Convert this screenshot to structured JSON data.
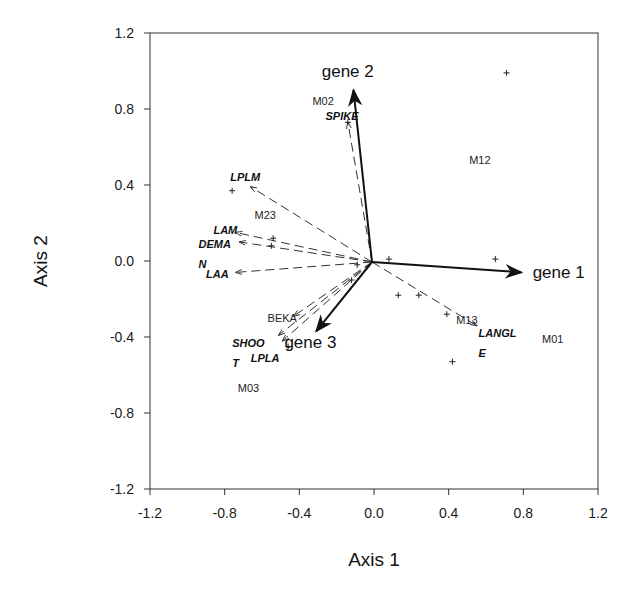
{
  "chart_data": {
    "type": "scatter",
    "subtype": "biplot-ordination",
    "title": "",
    "xlabel": "Axis 1",
    "ylabel": "Axis 2",
    "xlim": [
      -1.2,
      1.2
    ],
    "ylim": [
      -1.2,
      1.2
    ],
    "xticks": [
      "-1.2",
      "-0.8",
      "-0.4",
      "0.0",
      "0.4",
      "0.8",
      "1.2"
    ],
    "yticks": [
      "1.2",
      "0.8",
      "0.4",
      "0.0",
      "-0.4",
      "-0.8",
      "-1.2"
    ],
    "grid": false,
    "legend": null,
    "gene_vectors": [
      {
        "name": "gene 1",
        "x": 0.79,
        "y": -0.06,
        "label_x": 0.85,
        "label_y": -0.09
      },
      {
        "name": "gene 2",
        "x": -0.11,
        "y": 0.9,
        "label_x": -0.28,
        "label_y": 0.97
      },
      {
        "name": "gene 3",
        "x": -0.31,
        "y": -0.37,
        "label_x": -0.48,
        "label_y": -0.46
      }
    ],
    "trait_vectors": [
      {
        "name": "SPIKE",
        "x": -0.14,
        "y": 0.73,
        "label_lines": [
          "SPIKE"
        ],
        "label_x": -0.26,
        "label_y": 0.74
      },
      {
        "name": "LPLM",
        "x": -0.66,
        "y": 0.39,
        "label_lines": [
          "LPLM"
        ],
        "label_x": -0.77,
        "label_y": 0.42
      },
      {
        "name": "LAM",
        "x": -0.74,
        "y": 0.15,
        "label_lines": [
          "LAM"
        ],
        "label_x": -0.86,
        "label_y": 0.14
      },
      {
        "name": "DEMAN",
        "x": -0.72,
        "y": 0.1,
        "label_lines": [
          "DEMA",
          "N"
        ],
        "label_x": -0.94,
        "label_y": 0.07
      },
      {
        "name": "LAA",
        "x": -0.74,
        "y": -0.06,
        "label_lines": [
          "LAA"
        ],
        "label_x": -0.9,
        "label_y": -0.09
      },
      {
        "name": "LANGLE",
        "x": 0.55,
        "y": -0.34,
        "label_lines": [
          "LANGL",
          "E"
        ],
        "label_x": 0.56,
        "label_y": -0.4
      },
      {
        "name": "SHOOT",
        "x": -0.51,
        "y": -0.39,
        "label_lines": [
          "SHOO",
          "T"
        ],
        "label_x": -0.76,
        "label_y": -0.45
      },
      {
        "name": "LPLA",
        "x": -0.49,
        "y": -0.42,
        "label_lines": [
          "LPLA"
        ],
        "label_x": -0.66,
        "label_y": -0.53
      },
      {
        "name": "BEKA",
        "x": -0.43,
        "y": -0.29,
        "label_lines": [],
        "label_x": 0,
        "label_y": 0
      }
    ],
    "site_labels": [
      {
        "name": "M02",
        "x": -0.33,
        "y": 0.82
      },
      {
        "name": "M12",
        "x": 0.51,
        "y": 0.51
      },
      {
        "name": "M23",
        "x": -0.64,
        "y": 0.22
      },
      {
        "name": "BEKA",
        "x": -0.57,
        "y": -0.32
      },
      {
        "name": "M13",
        "x": 0.44,
        "y": -0.33
      },
      {
        "name": "M01",
        "x": 0.9,
        "y": -0.43
      },
      {
        "name": "M03",
        "x": -0.73,
        "y": -0.69
      }
    ],
    "sample_points": [
      {
        "x": 0.71,
        "y": 0.99
      },
      {
        "x": -0.76,
        "y": 0.37
      },
      {
        "x": -0.54,
        "y": 0.12
      },
      {
        "x": -0.55,
        "y": 0.08
      },
      {
        "x": 0.08,
        "y": 0.01
      },
      {
        "x": 0.65,
        "y": 0.01
      },
      {
        "x": 0.13,
        "y": -0.18
      },
      {
        "x": 0.24,
        "y": -0.18
      },
      {
        "x": 0.39,
        "y": -0.28
      },
      {
        "x": 0.42,
        "y": -0.53
      },
      {
        "x": -0.12,
        "y": -0.1
      },
      {
        "x": -0.09,
        "y": -0.02
      },
      {
        "x": -0.46,
        "y": -0.45
      },
      {
        "x": -0.14,
        "y": 0.73
      }
    ]
  },
  "colors": {
    "ink": "#111111",
    "frame": "#333333",
    "background": "#ffffff"
  }
}
